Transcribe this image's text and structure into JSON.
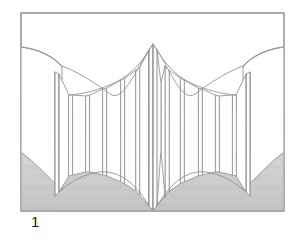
{
  "figure": {
    "caption": "1",
    "frame": {
      "x": 21,
      "y": 13,
      "width": 263,
      "height": 198,
      "stroke_color": "#8a8a8a",
      "stroke_width": 1.4,
      "fill_color": "#ffffff"
    },
    "colors": {
      "background": "#ffffff",
      "frame_stroke": "#8a8a8a",
      "panel_stroke": "#9a9a9a",
      "panel_fill": "#ffffff",
      "floor_fill": "#c9c9c9",
      "floor_fill_light": "#d2d2d2",
      "floor_stroke": "#8f8f8f",
      "caption_text": "#1a1a1a"
    },
    "scene": {
      "type": "line-drawing",
      "subject": "accordion room divider / curved partition wall",
      "view": "one-point interior perspective",
      "center_apex": {
        "x": 153,
        "y": 44
      },
      "center_base": {
        "x": 153,
        "y": 210
      },
      "vanishing_region": "center",
      "floor_shaded": true,
      "panel_count_left": 8,
      "panel_count_right": 8
    },
    "geometry": {
      "floor_left": "M21,210 L153,210 C128,178 96,160 55,152 C44,150 32,149 21,149 Z",
      "floor_right": "M284,210 L153,210 C178,178 210,160 251,152 C262,150 273,149 284,149 Z",
      "ceiling_left": "M21,47 C60,52 96,66 124,88 C140,101 149,113 153,122",
      "ceiling_right": "M284,47 C245,52 209,66 181,88 C165,101 156,113 153,122",
      "left_panels": [
        {
          "x1": 55,
          "ytop1": 72,
          "ybot1": 196,
          "x2": 58,
          "ytop2": 74,
          "ybot2": 192
        },
        {
          "x1": 69,
          "ytop1": 95,
          "ybot1": 176,
          "x2": 72,
          "ytop2": 96,
          "ybot2": 174
        },
        {
          "x1": 85,
          "ytop1": 96,
          "ybot1": 171,
          "x2": 88,
          "ytop2": 96,
          "ybot2": 171
        },
        {
          "x1": 101,
          "ytop1": 90,
          "ybot1": 173,
          "x2": 104,
          "ytop2": 89,
          "ybot2": 174
        },
        {
          "x1": 118,
          "ytop1": 80,
          "ybot1": 179,
          "x2": 121,
          "ytop2": 79,
          "ybot2": 181
        },
        {
          "x1": 133,
          "ytop1": 71,
          "ybot1": 186,
          "x2": 136,
          "ytop2": 69,
          "ybot2": 189
        },
        {
          "x1": 146,
          "ytop1": 52,
          "ybot1": 203,
          "x2": 149,
          "ytop2": 49,
          "ybot2": 206
        }
      ],
      "right_panels": [
        {
          "x1": 250,
          "ytop1": 72,
          "ybot1": 196,
          "x2": 247,
          "ytop2": 74,
          "ybot2": 192
        },
        {
          "x1": 236,
          "ytop1": 95,
          "ybot1": 176,
          "x2": 233,
          "ytop2": 96,
          "ybot2": 174
        },
        {
          "x1": 220,
          "ytop1": 96,
          "ybot1": 171,
          "x2": 217,
          "ytop2": 96,
          "ybot2": 171
        },
        {
          "x1": 204,
          "ytop1": 90,
          "ybot1": 173,
          "x2": 201,
          "ytop2": 89,
          "ybot2": 174
        },
        {
          "x1": 187,
          "ytop1": 80,
          "ybot1": 179,
          "x2": 184,
          "ytop2": 79,
          "ybot2": 181
        },
        {
          "x1": 172,
          "ytop1": 71,
          "ybot1": 186,
          "x2": 169,
          "ytop2": 69,
          "ybot2": 189
        },
        {
          "x1": 160,
          "ytop1": 52,
          "ybot1": 203,
          "x2": 157,
          "ytop2": 49,
          "ybot2": 206
        }
      ]
    }
  }
}
